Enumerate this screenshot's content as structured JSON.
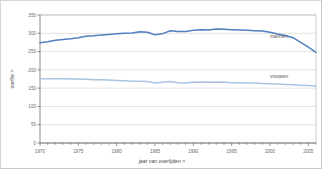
{
  "chart_data": {
    "type": "line",
    "title": "",
    "xlabel": "jaar van overlijden >",
    "ylabel": "sterfte >",
    "xlim": [
      1970,
      2006
    ],
    "ylim": [
      0,
      350
    ],
    "grid": true,
    "legend_position": "inline-right",
    "x_ticks": [
      1970,
      1975,
      1980,
      1985,
      1990,
      1995,
      2000,
      2005
    ],
    "x_tick_labels": [
      "1970",
      "1975",
      "1980",
      "1985",
      "1990",
      "1995",
      "2000",
      "2005"
    ],
    "y_ticks": [
      0,
      50,
      100,
      150,
      200,
      250,
      300,
      350
    ],
    "y_tick_labels": [
      "0",
      "50",
      "100",
      "150",
      "200",
      "250",
      "300",
      "350"
    ],
    "x": [
      1970,
      1971,
      1972,
      1973,
      1974,
      1975,
      1976,
      1977,
      1978,
      1979,
      1980,
      1981,
      1982,
      1983,
      1984,
      1985,
      1986,
      1987,
      1988,
      1989,
      1990,
      1991,
      1992,
      1993,
      1994,
      1995,
      1996,
      1997,
      1998,
      1999,
      2000,
      2001,
      2002,
      2003,
      2004,
      2005,
      2006
    ],
    "series": [
      {
        "name": "mannen",
        "color": "#4f7fbf",
        "label_x": 2000,
        "label_y": 288,
        "values": [
          274,
          277,
          281,
          283,
          285,
          288,
          292,
          293,
          295,
          297,
          299,
          300,
          301,
          304,
          303,
          296,
          299,
          307,
          305,
          305,
          308,
          310,
          309,
          312,
          311,
          310,
          309,
          308,
          307,
          306,
          303,
          298,
          294,
          288,
          275,
          262,
          248
        ]
      },
      {
        "name": "vrouwen",
        "color": "#a8c4e0",
        "label_x": 2000,
        "label_y": 178,
        "values": [
          176,
          176,
          176,
          176,
          175,
          175,
          174,
          173,
          173,
          172,
          171,
          170,
          169,
          169,
          168,
          164,
          166,
          168,
          165,
          164,
          166,
          167,
          166,
          167,
          166,
          165,
          165,
          164,
          164,
          163,
          162,
          161,
          160,
          159,
          158,
          157,
          156
        ]
      }
    ]
  },
  "axes": {
    "x_title": "jaar van overlijden >",
    "y_title": "sterfte >"
  }
}
